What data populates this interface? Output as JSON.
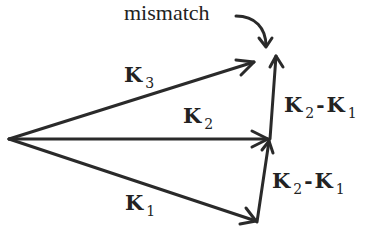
{
  "diagram": {
    "annotation": "mismatch",
    "vectors": [
      {
        "name": "K1",
        "label_base": "K",
        "label_sub": "1",
        "from": [
          9,
          139
        ],
        "to": [
          257,
          222
        ]
      },
      {
        "name": "K2",
        "label_base": "K",
        "label_sub": "2",
        "from": [
          9,
          139
        ],
        "to": [
          270,
          139
        ]
      },
      {
        "name": "K3",
        "label_base": "K",
        "label_sub": "3",
        "from": [
          9,
          139
        ],
        "to": [
          255,
          62
        ]
      },
      {
        "name": "K2-K1 (lower)",
        "from": [
          257,
          222
        ],
        "to": [
          270,
          139
        ]
      },
      {
        "name": "K2-K1 (upper)",
        "from": [
          270,
          139
        ],
        "to": [
          276,
          55
        ]
      }
    ],
    "labels": {
      "k3": {
        "base": "K",
        "sub": "3"
      },
      "k2": {
        "base": "K",
        "sub": "2"
      },
      "k1": {
        "base": "K",
        "sub": "1"
      },
      "diff_upper": {
        "a_base": "K",
        "a_sub": "2",
        "op": "-",
        "b_base": "K",
        "b_sub": "1"
      },
      "diff_lower": {
        "a_base": "K",
        "a_sub": "2",
        "op": "-",
        "b_base": "K",
        "b_sub": "1"
      }
    },
    "stroke_color": "#2a2a2a"
  }
}
